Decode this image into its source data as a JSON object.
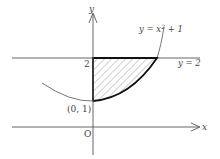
{
  "diagram": {
    "axes": {
      "x_label": "x",
      "y_label": "y",
      "origin_label": "O"
    },
    "curve_label_prefix": "y = x",
    "curve_label_exp": "2",
    "curve_label_suffix": " + 1",
    "line_label": "y = 2",
    "y_tick_label": "2",
    "point_label": "(0, 1)",
    "shaded_region": "region bounded by y-axis, y = 2, and y = x^2 + 1 for x ≥ 0",
    "colors": {
      "stroke": "#555555",
      "boundary": "#111111",
      "hatch": "#777777"
    }
  }
}
